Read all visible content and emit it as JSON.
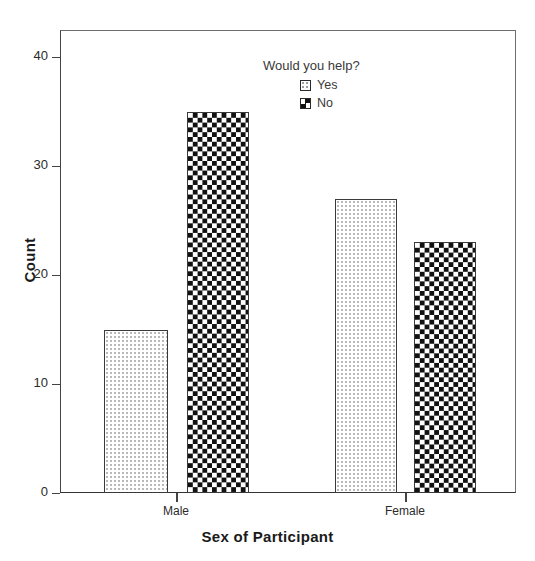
{
  "chart_data": {
    "type": "bar",
    "title": "",
    "subtitle": "",
    "xlabel": "Sex of Participant",
    "ylabel": "Count",
    "categories": [
      "Male",
      "Female"
    ],
    "series": [
      {
        "name": "Yes",
        "values": [
          15,
          27
        ],
        "pattern": "light-dotted"
      },
      {
        "name": "No",
        "values": [
          35,
          23
        ],
        "pattern": "checkerboard"
      }
    ],
    "legend": {
      "title": "Would you help?",
      "position": "inside-top-center",
      "entries": [
        {
          "label": "Yes",
          "swatch": "light-dotted-swatch"
        },
        {
          "label": "No",
          "swatch": "checkerboard-swatch"
        }
      ]
    },
    "ylim": [
      0,
      42
    ],
    "yticks": [
      0,
      10,
      20,
      30,
      40
    ],
    "ytick_labels": [
      "0",
      "10",
      "20",
      "30",
      "40"
    ],
    "xtick_labels": [
      "Male",
      "Female"
    ],
    "grid": false,
    "clustered": true,
    "colors": {
      "bar_outline": "#3a3a3a",
      "checker_dark": "#111111",
      "dot_fill": "#b9b9b9",
      "axis": "#444444",
      "text": "#2b2b2b",
      "background": "#ffffff"
    }
  },
  "axes": {
    "y": {
      "label": "Count",
      "ticks": [
        {
          "value": "40",
          "pos_pct": 95.238
        },
        {
          "value": "30",
          "pos_pct": 71.429
        },
        {
          "value": "20",
          "pos_pct": 47.619
        },
        {
          "value": "10",
          "pos_pct": 23.81
        },
        {
          "value": "0",
          "pos_pct": 0
        }
      ]
    },
    "x": {
      "label": "Sex of Participant",
      "ticks": [
        {
          "value": "Male"
        },
        {
          "value": "Female"
        }
      ]
    }
  },
  "bars": [
    {
      "group": "Male",
      "series": "Yes",
      "value": 15,
      "left": 104,
      "width": 64,
      "fill": "fill-yes"
    },
    {
      "group": "Male",
      "series": "No",
      "value": 35,
      "left": 187,
      "width": 62,
      "fill": "fill-no"
    },
    {
      "group": "Female",
      "series": "Yes",
      "value": 27,
      "left": 335,
      "width": 62,
      "fill": "fill-yes"
    },
    {
      "group": "Female",
      "series": "No",
      "value": 23,
      "left": 414,
      "width": 62,
      "fill": "fill-no"
    }
  ],
  "tick_positions": {
    "x": [
      176,
      405
    ]
  }
}
